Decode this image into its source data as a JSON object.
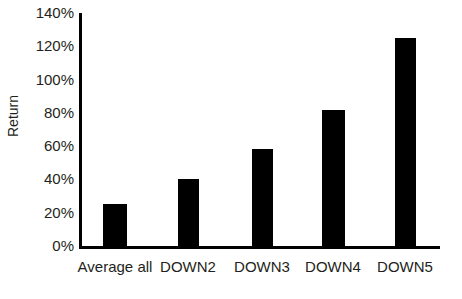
{
  "chart_data": {
    "type": "bar",
    "title": "",
    "subtitle": "",
    "xlabel": "",
    "ylabel": "Return",
    "categories": [
      "Average all",
      "DOWN2",
      "DOWN3",
      "DOWN4",
      "DOWN5"
    ],
    "values": [
      25,
      40,
      58,
      82,
      125
    ],
    "value_labels": [
      "25%",
      "40%",
      "58%",
      "82%",
      "125%"
    ],
    "ylim": [
      0,
      140
    ],
    "ytick_values": [
      0,
      20,
      40,
      60,
      80,
      100,
      120,
      140
    ],
    "ytick_labels": [
      "0%",
      "20%",
      "40%",
      "60%",
      "80%",
      "100%",
      "120%",
      "140%"
    ],
    "grid": false,
    "legend": false,
    "legend_position": "none",
    "series": [
      {
        "name": "Return",
        "color": "#000000",
        "values": [
          25,
          40,
          58,
          82,
          125
        ]
      }
    ],
    "annotations": []
  },
  "style": {
    "background": "#ffffff",
    "axis_color": "#000000",
    "text_color": "#231f20",
    "bar_color": "#000000"
  }
}
